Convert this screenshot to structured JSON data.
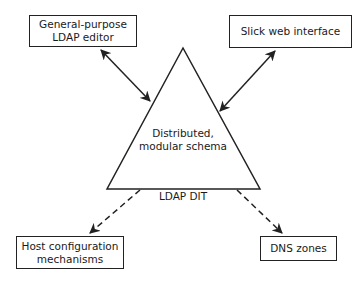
{
  "diagram": {
    "center": {
      "shape": "triangle",
      "label_line1": "Distributed,",
      "label_line2": "modular schema",
      "caption": "LDAP DIT"
    },
    "nodes": [
      {
        "id": "ldap-editor",
        "line1": "General-purpose",
        "line2": "LDAP editor",
        "connection": "bidirectional-solid"
      },
      {
        "id": "web-interface",
        "line1": "Slick web interface",
        "line2": "",
        "connection": "bidirectional-solid"
      },
      {
        "id": "host-config",
        "line1": "Host configuration",
        "line2": "mechanisms",
        "connection": "outgoing-dashed"
      },
      {
        "id": "dns-zones",
        "line1": "DNS zones",
        "line2": "",
        "connection": "outgoing-dashed"
      }
    ],
    "colors": {
      "stroke": "#222222",
      "background": "#ffffff"
    }
  }
}
